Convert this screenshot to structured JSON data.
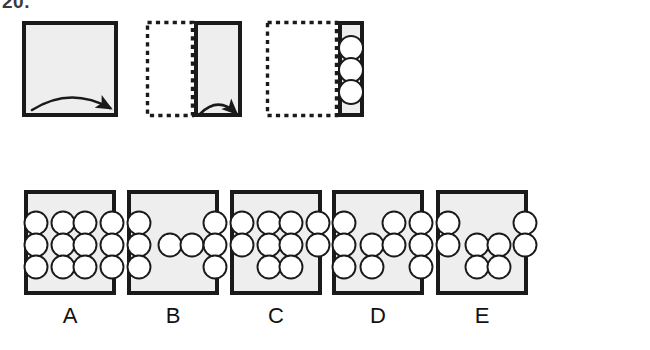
{
  "page": {
    "clipped_header_text": "20.",
    "background_color": "#ffffff",
    "ink_color": "#1a1a1a",
    "paper_fill_color": "#eeeeee",
    "circle_fill_color": "#ffffff",
    "width": 650,
    "height": 350
  },
  "prompt": {
    "type": "paper-folding-sequence",
    "description": "A square sheet is folded, then holes are punched; choose the unfolded result.",
    "steps": [
      {
        "step_index": 1,
        "name": "unfolded-sheet",
        "outline": "solid",
        "shape": "square",
        "x": 22,
        "y": 21,
        "width": 96,
        "height": 96,
        "fold_arrow": {
          "present": true,
          "direction": "left-to-right",
          "label": "fold-arrow-wide",
          "start_x": 32,
          "start_y": 110,
          "ctrl_x": 70,
          "ctrl_y": 86,
          "end_x": 110,
          "end_y": 108
        },
        "holes": []
      },
      {
        "step_index": 2,
        "name": "half-folded-sheet",
        "ghost": {
          "outline": "dotted",
          "x": 146,
          "y": 21,
          "width": 48,
          "height": 96
        },
        "solid": {
          "outline": "solid",
          "x": 194,
          "y": 21,
          "width": 48,
          "height": 96
        },
        "fold_arrow": {
          "present": true,
          "direction": "left-to-right",
          "label": "fold-arrow-narrow",
          "start_x": 200,
          "start_y": 114,
          "ctrl_x": 218,
          "ctrl_y": 96,
          "end_x": 236,
          "end_y": 113
        },
        "holes": []
      },
      {
        "step_index": 3,
        "name": "quarter-folded-punched-sheet",
        "ghost": {
          "outline": "dotted",
          "x": 266,
          "y": 21,
          "width": 72,
          "height": 96
        },
        "solid": {
          "outline": "solid",
          "x": 338,
          "y": 21,
          "width": 26,
          "height": 96
        },
        "fold_arrow": {
          "present": false
        },
        "holes": [
          {
            "cx": 351,
            "cy": 48,
            "r": 12
          },
          {
            "cx": 351,
            "cy": 70,
            "r": 12
          },
          {
            "cx": 351,
            "cy": 92,
            "r": 12
          }
        ]
      }
    ]
  },
  "options": {
    "count": 5,
    "box": {
      "width": 92,
      "height": 105,
      "top": 190
    },
    "label_top": 305,
    "circle_radius": 11.5,
    "items": [
      {
        "id": "A",
        "label": "A",
        "name": "option-a",
        "box_x": 24,
        "hole_count": 12,
        "holes": [
          {
            "cx": 36,
            "cy": 223
          },
          {
            "cx": 36,
            "cy": 245
          },
          {
            "cx": 36,
            "cy": 267
          },
          {
            "cx": 63,
            "cy": 223
          },
          {
            "cx": 63,
            "cy": 245
          },
          {
            "cx": 63,
            "cy": 267
          },
          {
            "cx": 85,
            "cy": 223
          },
          {
            "cx": 85,
            "cy": 245
          },
          {
            "cx": 85,
            "cy": 267
          },
          {
            "cx": 112,
            "cy": 223
          },
          {
            "cx": 112,
            "cy": 245
          },
          {
            "cx": 112,
            "cy": 267
          }
        ]
      },
      {
        "id": "B",
        "label": "B",
        "name": "option-b",
        "box_x": 127,
        "hole_count": 8,
        "holes": [
          {
            "cx": 139,
            "cy": 223
          },
          {
            "cx": 139,
            "cy": 245
          },
          {
            "cx": 139,
            "cy": 267
          },
          {
            "cx": 170,
            "cy": 245
          },
          {
            "cx": 192,
            "cy": 245
          },
          {
            "cx": 215,
            "cy": 223
          },
          {
            "cx": 215,
            "cy": 245
          },
          {
            "cx": 215,
            "cy": 267
          }
        ]
      },
      {
        "id": "C",
        "label": "C",
        "name": "option-c",
        "hole_count": 10,
        "box_x": 230,
        "holes": [
          {
            "cx": 242,
            "cy": 223
          },
          {
            "cx": 242,
            "cy": 245
          },
          {
            "cx": 269,
            "cy": 223
          },
          {
            "cx": 269,
            "cy": 245
          },
          {
            "cx": 269,
            "cy": 267
          },
          {
            "cx": 291,
            "cy": 223
          },
          {
            "cx": 291,
            "cy": 245
          },
          {
            "cx": 291,
            "cy": 267
          },
          {
            "cx": 318,
            "cy": 223
          },
          {
            "cx": 318,
            "cy": 245
          }
        ]
      },
      {
        "id": "D",
        "label": "D",
        "name": "option-d",
        "hole_count": 10,
        "box_x": 332,
        "holes": [
          {
            "cx": 344,
            "cy": 223
          },
          {
            "cx": 344,
            "cy": 245
          },
          {
            "cx": 344,
            "cy": 267
          },
          {
            "cx": 372,
            "cy": 245
          },
          {
            "cx": 372,
            "cy": 267
          },
          {
            "cx": 394,
            "cy": 223
          },
          {
            "cx": 394,
            "cy": 245
          },
          {
            "cx": 421,
            "cy": 223
          },
          {
            "cx": 421,
            "cy": 245
          },
          {
            "cx": 421,
            "cy": 267
          }
        ]
      },
      {
        "id": "E",
        "label": "E",
        "name": "option-e",
        "hole_count": 8,
        "box_x": 436,
        "holes": [
          {
            "cx": 448,
            "cy": 223
          },
          {
            "cx": 448,
            "cy": 245
          },
          {
            "cx": 477,
            "cy": 245
          },
          {
            "cx": 477,
            "cy": 267
          },
          {
            "cx": 499,
            "cy": 245
          },
          {
            "cx": 499,
            "cy": 267
          },
          {
            "cx": 525,
            "cy": 223
          },
          {
            "cx": 525,
            "cy": 245
          }
        ]
      }
    ]
  }
}
